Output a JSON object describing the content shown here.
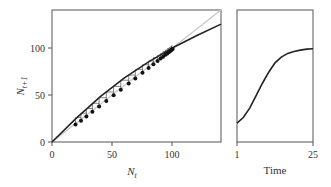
{
  "chart_data": [
    {
      "type": "scatter",
      "title": "",
      "xlabel": "N_t",
      "ylabel": "N_t+1",
      "xlim": [
        0,
        140
      ],
      "ylim": [
        0,
        140
      ],
      "xticks": [
        "0",
        "50",
        "100"
      ],
      "yticks": [
        "0",
        "50",
        "100"
      ],
      "grid": false,
      "series": [
        {
          "name": "observed",
          "kind": "points",
          "x": [
            19.5,
            24,
            28.5,
            33.5,
            39,
            45,
            51,
            57,
            63.5,
            69,
            75,
            80,
            84,
            87.5,
            90,
            92,
            94,
            95.5,
            97,
            98,
            99,
            100
          ],
          "y": [
            20,
            24,
            28.5,
            33.5,
            39,
            45,
            51,
            57,
            63.5,
            69,
            75,
            80,
            84,
            87.5,
            90,
            92,
            94,
            95.5,
            97,
            98,
            99,
            100
          ]
        },
        {
          "name": "model curve",
          "kind": "line",
          "color": "#222222",
          "x": [
            0,
            20,
            40,
            60,
            80,
            100,
            120,
            140
          ],
          "y": [
            0,
            25,
            48,
            68,
            85,
            100,
            113,
            125
          ]
        },
        {
          "name": "1:1 line",
          "kind": "line",
          "color": "#c8c8c8",
          "x": [
            0,
            140
          ],
          "y": [
            0,
            140
          ]
        }
      ]
    },
    {
      "type": "line",
      "title": "",
      "xlabel": "Time",
      "ylabel": "",
      "xlim": [
        1,
        25
      ],
      "xticks": [
        "1",
        "25"
      ],
      "grid": false,
      "series": [
        {
          "name": "N over time",
          "color": "#222222",
          "x": [
            1,
            3,
            5,
            7,
            9,
            11,
            13,
            15,
            17,
            19,
            21,
            23,
            25
          ],
          "y": [
            20,
            26,
            36,
            49,
            62,
            74,
            84,
            90,
            94,
            96,
            97.5,
            98.5,
            99
          ]
        }
      ]
    }
  ],
  "labels": {
    "left_x": "N",
    "left_x_sub": "t",
    "left_y": "N",
    "left_y_sub": "t+1",
    "right_x": "Time",
    "ticks_left_x": [
      "0",
      "50",
      "100"
    ],
    "ticks_left_y": [
      "0",
      "50",
      "100"
    ],
    "ticks_right_x": [
      "1",
      "25"
    ]
  }
}
